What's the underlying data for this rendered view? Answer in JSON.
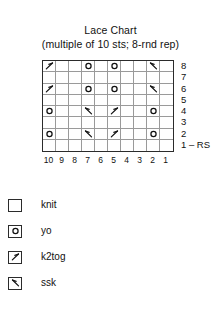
{
  "title": {
    "main": "Lace Chart",
    "sub": "(multiple of 10 sts; 8-rnd rep)"
  },
  "chart_data": {
    "type": "table",
    "title": "Lace Chart",
    "subtitle": "(multiple of 10 sts; 8-rnd rep)",
    "columns": 10,
    "rows": 8,
    "column_labels": [
      "10",
      "9",
      "8",
      "7",
      "6",
      "5",
      "4",
      "3",
      "2",
      "1"
    ],
    "row_labels": [
      "8",
      "7",
      "6",
      "5",
      "4",
      "3",
      "2",
      "1 – RS"
    ],
    "symbol_key": {
      "knit": "",
      "yo": "o",
      "k2tog": "k2tog",
      "ssk": "ssk"
    },
    "grid": [
      {
        "row_label": "8",
        "cells": [
          "k2tog",
          "knit",
          "knit",
          "yo",
          "knit",
          "yo",
          "knit",
          "knit",
          "ssk",
          "knit"
        ]
      },
      {
        "row_label": "7",
        "cells": [
          "knit",
          "knit",
          "knit",
          "knit",
          "knit",
          "knit",
          "knit",
          "knit",
          "knit",
          "knit"
        ]
      },
      {
        "row_label": "6",
        "cells": [
          "k2tog",
          "knit",
          "knit",
          "yo",
          "knit",
          "yo",
          "knit",
          "knit",
          "ssk",
          "knit"
        ]
      },
      {
        "row_label": "5",
        "cells": [
          "knit",
          "knit",
          "knit",
          "knit",
          "knit",
          "knit",
          "knit",
          "knit",
          "knit",
          "knit"
        ]
      },
      {
        "row_label": "4",
        "cells": [
          "yo",
          "knit",
          "knit",
          "ssk",
          "knit",
          "k2tog",
          "knit",
          "knit",
          "yo",
          "knit"
        ]
      },
      {
        "row_label": "3",
        "cells": [
          "knit",
          "knit",
          "knit",
          "knit",
          "knit",
          "knit",
          "knit",
          "knit",
          "knit",
          "knit"
        ]
      },
      {
        "row_label": "2",
        "cells": [
          "yo",
          "knit",
          "knit",
          "ssk",
          "knit",
          "k2tog",
          "knit",
          "knit",
          "yo",
          "knit"
        ]
      },
      {
        "row_label": "1 – RS",
        "cells": [
          "knit",
          "knit",
          "knit",
          "knit",
          "knit",
          "knit",
          "knit",
          "knit",
          "knit",
          "knit"
        ]
      }
    ]
  },
  "legend": {
    "items": [
      {
        "symbol": "knit",
        "label": "knit",
        "icon": "empty-square-icon"
      },
      {
        "symbol": "yo",
        "label": "yo",
        "icon": "circle-icon"
      },
      {
        "symbol": "k2tog",
        "label": "k2tog",
        "icon": "k2tog-slant-icon"
      },
      {
        "symbol": "ssk",
        "label": "ssk",
        "icon": "ssk-slant-icon"
      }
    ]
  },
  "colors": {
    "ink": "#111111",
    "grid_outer": "#2b2b2b",
    "grid_inner": "#9a9a9a",
    "background": "#ffffff"
  }
}
